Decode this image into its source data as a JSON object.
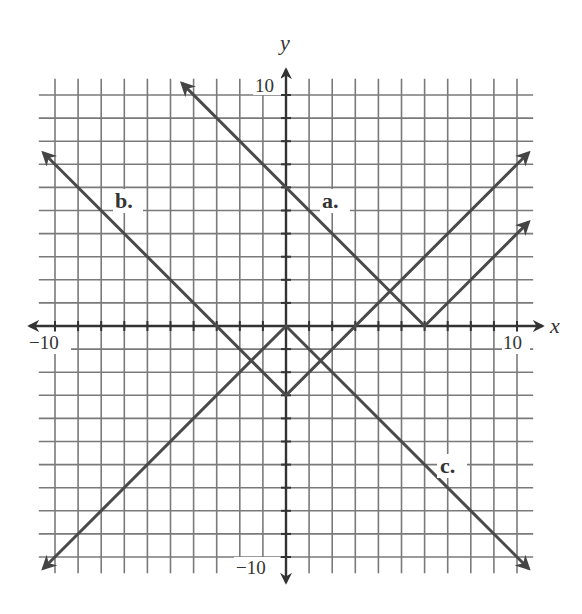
{
  "chart_data": {
    "type": "line",
    "title": "",
    "xlabel": "x",
    "ylabel": "y",
    "xlim": [
      -10,
      10
    ],
    "ylim": [
      -10,
      10
    ],
    "grid": true,
    "grid_step": 1,
    "tick_labels": {
      "x": [
        {
          "value": -10,
          "label": "−10"
        },
        {
          "value": 10,
          "label": "10"
        }
      ],
      "y": [
        {
          "value": 10,
          "label": "10"
        },
        {
          "value": -10,
          "label": "−10"
        }
      ]
    },
    "series": [
      {
        "name": "a.",
        "equation": "y = |x - 6|",
        "vertex": [
          6,
          0
        ],
        "points": [
          [
            -4.5,
            10.5
          ],
          [
            6,
            0
          ],
          [
            10.5,
            4.5
          ]
        ],
        "label_position": [
          2,
          5
        ]
      },
      {
        "name": "b.",
        "equation": "y = |x| - 3",
        "vertex": [
          0,
          -3
        ],
        "points": [
          [
            -10.5,
            7.5
          ],
          [
            0,
            -3
          ],
          [
            10.5,
            7.5
          ]
        ],
        "label_position": [
          -7,
          5
        ]
      },
      {
        "name": "c.",
        "equation": "y = -|x|",
        "vertex": [
          0,
          0
        ],
        "points": [
          [
            -10.5,
            -10.5
          ],
          [
            0,
            0
          ],
          [
            10.5,
            -10.5
          ]
        ],
        "label_position": [
          7,
          -6
        ]
      }
    ],
    "legend": "inline labels"
  },
  "labels": {
    "x_axis": "x",
    "y_axis": "y",
    "x_min": "−10",
    "x_max": "10",
    "y_max": "10",
    "y_min": "−10",
    "graph_a": "a.",
    "graph_b": "b.",
    "graph_c": "c."
  },
  "colors": {
    "grid": "#7a7a7a",
    "axis": "#333333",
    "graph": "#4a4a4a",
    "background": "#ffffff"
  }
}
